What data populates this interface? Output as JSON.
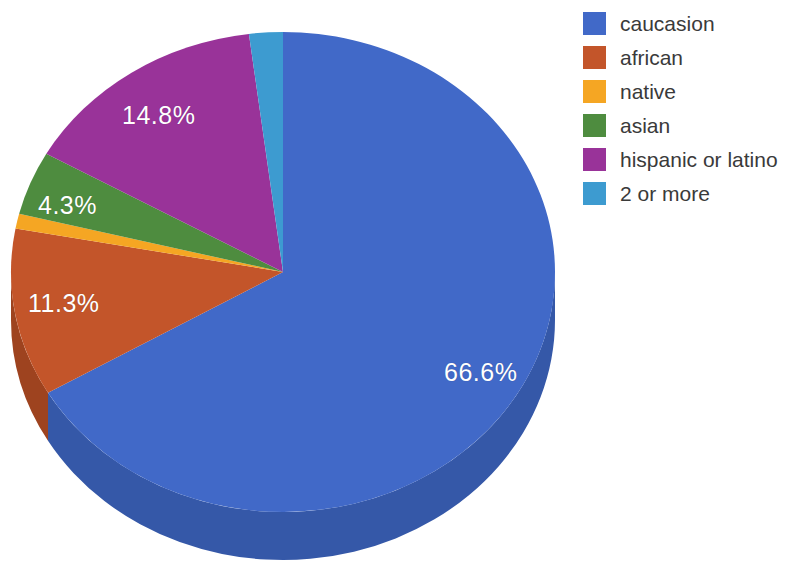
{
  "chart_data": {
    "type": "pie",
    "title": "",
    "subtitle": "",
    "xlabel": "",
    "ylabel": "",
    "three_d": true,
    "start_angle_deg": 0,
    "direction": "clockwise",
    "legend_position": "right",
    "grid": false,
    "categories": [
      "caucasion",
      "african",
      "native",
      "asian",
      "hispanic or latino",
      "2 or more"
    ],
    "values": [
      66.6,
      11.3,
      1.0,
      4.3,
      14.8,
      2.0
    ],
    "value_unit": "%",
    "colors": [
      "#4169C8",
      "#C3552A",
      "#F5A623",
      "#4E8C3F",
      "#993399",
      "#3D9BD0"
    ],
    "side_colors": [
      "#3558A8",
      "#9E431F",
      "#C9871A",
      "#3D7031",
      "#7A2A7A",
      "#2E7CA8"
    ],
    "slices": [
      {
        "label": "caucasion",
        "value": 66.6,
        "color": "#4169C8",
        "side_color": "#3558A8",
        "data_label": "66.6%",
        "data_label_shown": true
      },
      {
        "label": "african",
        "value": 11.3,
        "color": "#C3552A",
        "side_color": "#9E431F",
        "data_label": "11.3%",
        "data_label_shown": true
      },
      {
        "label": "native",
        "value": 1.0,
        "color": "#F5A623",
        "side_color": "#C9871A",
        "data_label": "",
        "data_label_shown": false
      },
      {
        "label": "asian",
        "value": 4.3,
        "color": "#4E8C3F",
        "side_color": "#3D7031",
        "data_label": "4.3%",
        "data_label_shown": true
      },
      {
        "label": "hispanic or latino",
        "value": 14.8,
        "color": "#993399",
        "side_color": "#7A2A7A",
        "data_label": "14.8%",
        "data_label_shown": true
      },
      {
        "label": "2 or more",
        "value": 2.0,
        "color": "#3D9BD0",
        "side_color": "#2E7CA8",
        "data_label": "",
        "data_label_shown": false
      }
    ],
    "data_labels": [
      "66.6%",
      "11.3%",
      "4.3%",
      "14.8%"
    ]
  },
  "labels": {
    "caucasion": "66.6%",
    "african": "11.3%",
    "asian": "4.3%",
    "hispanic": "14.8%"
  },
  "legend": {
    "items": [
      {
        "label": "caucasion",
        "color": "#4169C8"
      },
      {
        "label": "african",
        "color": "#C3552A"
      },
      {
        "label": "native",
        "color": "#F5A623"
      },
      {
        "label": "asian",
        "color": "#4E8C3F"
      },
      {
        "label": "hispanic or latino",
        "color": "#993399"
      },
      {
        "label": "2 or more",
        "color": "#3D9BD0"
      }
    ]
  }
}
